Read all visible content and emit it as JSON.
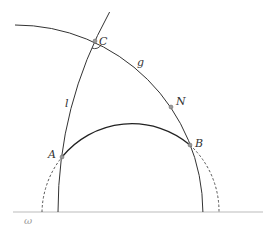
{
  "diagram": {
    "type": "hyperbolic-geometry-figure",
    "labels": {
      "C": "C",
      "g": "g",
      "N": "N",
      "l": "l",
      "A": "A",
      "B": "B",
      "omega": "ω"
    },
    "points": [
      {
        "name": "A",
        "x": 62,
        "y": 157
      },
      {
        "name": "B",
        "x": 190,
        "y": 145
      },
      {
        "name": "C",
        "x": 95,
        "y": 41
      },
      {
        "name": "N",
        "x": 171,
        "y": 107
      }
    ],
    "curves": [
      {
        "name": "g",
        "style": "solid",
        "description": "large arc through C, N, B"
      },
      {
        "name": "l",
        "style": "solid",
        "description": "arc through A and C"
      },
      {
        "name": "semicircle-AB",
        "style": "solid between A and B, dashed outside"
      },
      {
        "name": "omega",
        "style": "baseline",
        "description": "boundary line"
      }
    ],
    "colors": {
      "stroke": "#333333",
      "baseline": "#bbbbbb",
      "point": "#888888"
    }
  }
}
